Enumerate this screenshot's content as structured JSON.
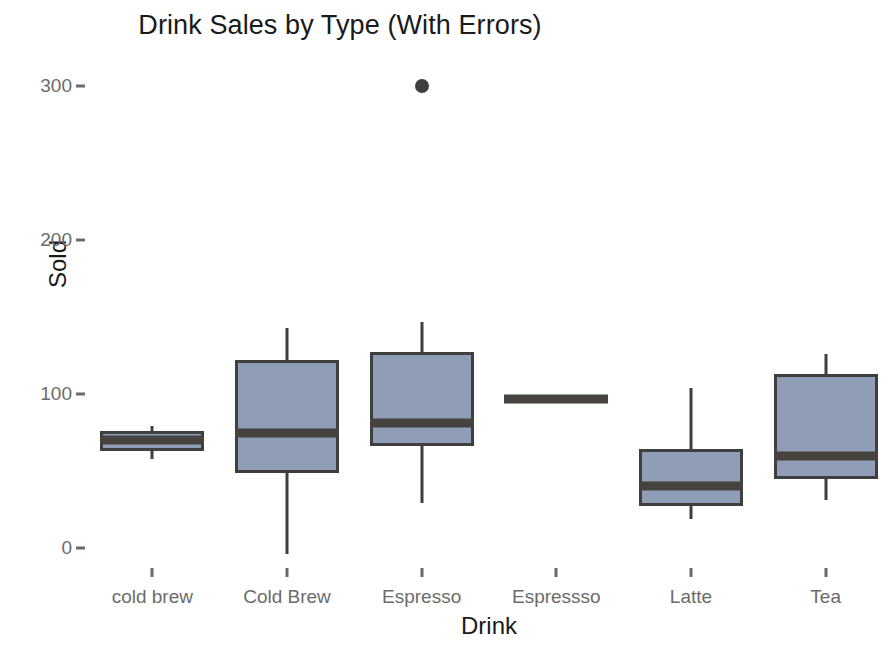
{
  "chart_data": {
    "type": "box",
    "title": "Drink Sales by Type (With Errors)",
    "xlabel": "Drink",
    "ylabel": "Sold",
    "categories": [
      "cold brew",
      "Cold Brew",
      "Espresso",
      "Espressso",
      "Latte",
      "Tea"
    ],
    "ylim": [
      -20,
      310
    ],
    "y_ticks": [
      0,
      100,
      200,
      300
    ],
    "y_tick_labels": [
      "0",
      "100",
      "200",
      "300"
    ],
    "grid": false,
    "legend": false,
    "box_fill_color": "#8f9db6",
    "box_line_color": "#3f3f3f",
    "median_color": "#46423f",
    "outlier_color": "#3f3f3f",
    "background_color": "#ffffff",
    "boxes": [
      {
        "category": "cold brew",
        "whisker_low": 58,
        "q1": 63,
        "median": 70,
        "q3": 76,
        "whisker_high": 79,
        "outliers": [],
        "degenerate": false
      },
      {
        "category": "Cold Brew",
        "whisker_low": -4,
        "q1": 49,
        "median": 75,
        "q3": 122,
        "whisker_high": 143,
        "outliers": [],
        "degenerate": false
      },
      {
        "category": "Espresso",
        "whisker_low": 29,
        "q1": 66,
        "median": 81,
        "q3": 127,
        "whisker_high": 147,
        "outliers": [
          300
        ],
        "degenerate": false
      },
      {
        "category": "Espressso",
        "whisker_low": 97,
        "q1": 97,
        "median": 97,
        "q3": 97,
        "whisker_high": 97,
        "outliers": [],
        "degenerate": true
      },
      {
        "category": "Latte",
        "whisker_low": 19,
        "q1": 27,
        "median": 40,
        "q3": 64,
        "whisker_high": 104,
        "outliers": [],
        "degenerate": false
      },
      {
        "category": "Tea",
        "whisker_low": 31,
        "q1": 45,
        "median": 60,
        "q3": 113,
        "whisker_high": 126,
        "outliers": [],
        "degenerate": false
      }
    ]
  }
}
